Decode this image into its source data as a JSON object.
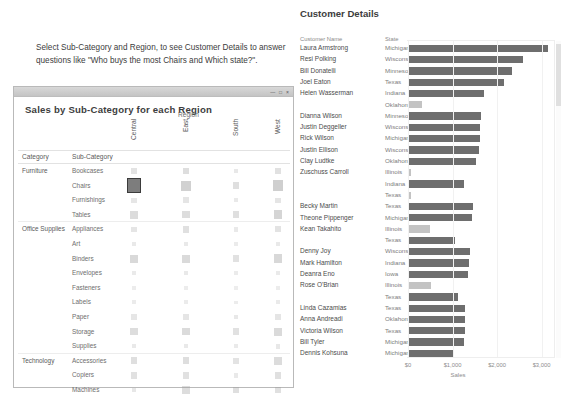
{
  "instruction": {
    "text": "Select  Sub-Category and Region, to see Customer Details to answer questions like \"Who buys the most Chairs and Which state?\"."
  },
  "matrix_window": {
    "title": "Sales by Sub-Category for each Region",
    "window_controls": "— □ ×",
    "region_label": "Region",
    "header_category": "Category",
    "header_subcategory": "Sub-Category",
    "columns": [
      "Central",
      "East",
      "South",
      "West"
    ],
    "groups": [
      {
        "category": "Furniture",
        "rows": [
          {
            "sub_category": "Bookcases",
            "values": [
              0.3,
              0.42,
              0.18,
              0.34
            ]
          },
          {
            "sub_category": "Chairs",
            "values": [
              1.0,
              0.72,
              0.4,
              0.78
            ],
            "selected_column": "Central"
          },
          {
            "sub_category": "Furnishings",
            "values": [
              0.22,
              0.26,
              0.14,
              0.24
            ]
          },
          {
            "sub_category": "Tables",
            "values": [
              0.48,
              0.46,
              0.4,
              0.62
            ]
          }
        ]
      },
      {
        "category": "Office Supplies",
        "rows": [
          {
            "sub_category": "Appliances",
            "values": [
              0.26,
              0.38,
              0.16,
              0.3
            ]
          },
          {
            "sub_category": "Art",
            "values": [
              0.14,
              0.16,
              0.1,
              0.15
            ]
          },
          {
            "sub_category": "Binders",
            "values": [
              0.54,
              0.52,
              0.34,
              0.58
            ]
          },
          {
            "sub_category": "Envelopes",
            "values": [
              0.13,
              0.14,
              0.1,
              0.13
            ]
          },
          {
            "sub_category": "Fasteners",
            "values": [
              0.07,
              0.07,
              0.06,
              0.07
            ]
          },
          {
            "sub_category": "Labels",
            "values": [
              0.1,
              0.1,
              0.08,
              0.12
            ]
          },
          {
            "sub_category": "Paper",
            "values": [
              0.22,
              0.26,
              0.18,
              0.26
            ]
          },
          {
            "sub_category": "Storage",
            "values": [
              0.46,
              0.5,
              0.34,
              0.52
            ]
          },
          {
            "sub_category": "Supplies",
            "values": [
              0.16,
              0.16,
              0.12,
              0.18
            ]
          }
        ]
      },
      {
        "category": "Technology",
        "rows": [
          {
            "sub_category": "Accessories",
            "values": [
              0.4,
              0.42,
              0.3,
              0.48
            ]
          },
          {
            "sub_category": "Copiers",
            "values": [
              0.34,
              0.34,
              0.16,
              0.38
            ]
          },
          {
            "sub_category": "Machines",
            "values": [
              0.2,
              0.44,
              0.4,
              0.38
            ]
          },
          {
            "sub_category": "Phones",
            "values": [
              0.56,
              0.58,
              0.44,
              0.62
            ]
          }
        ]
      }
    ]
  },
  "customer_panel": {
    "title": "Customer Details",
    "header_name": "Customer Name",
    "header_state": "State"
  },
  "chart_data": {
    "type": "bar",
    "title": "Customer Details",
    "xlabel": "Sales",
    "ylabel": "",
    "orientation": "horizontal",
    "xlim": [
      0,
      3250
    ],
    "xticks": [
      0,
      1000,
      2000,
      3000
    ],
    "xtick_labels": [
      "$0",
      "$1,000",
      "$2,000",
      "$3,000"
    ],
    "grid": false,
    "columns": [
      "Customer Name",
      "State",
      "Sales"
    ],
    "rows": [
      {
        "customer_name": "Laura Armstrong",
        "state": "Michigan",
        "sales": 3140,
        "highlight": true
      },
      {
        "customer_name": "Resi Polking",
        "state": "Wisconsin",
        "sales": 2580,
        "highlight": true
      },
      {
        "customer_name": "Bill Donatelli",
        "state": "Minnesota",
        "sales": 2330,
        "highlight": true
      },
      {
        "customer_name": "Joel Eaton",
        "state": "Texas",
        "sales": 2160,
        "highlight": true
      },
      {
        "customer_name": "Helen Wasserman",
        "state": "Indiana",
        "sales": 1710,
        "highlight": true
      },
      {
        "customer_name": "",
        "state": "Oklahoma",
        "sales": 310,
        "highlight": false
      },
      {
        "customer_name": "Dianna Wilson",
        "state": "Minnesota",
        "sales": 1630,
        "highlight": true
      },
      {
        "customer_name": "Justin Deggeller",
        "state": "Wisconsin",
        "sales": 1620,
        "highlight": true
      },
      {
        "customer_name": "Rick Wilson",
        "state": "Michigan",
        "sales": 1610,
        "highlight": true
      },
      {
        "customer_name": "Justin Ellison",
        "state": "Wisconsin",
        "sales": 1590,
        "highlight": true
      },
      {
        "customer_name": "Clay Ludtke",
        "state": "Oklahoma",
        "sales": 1530,
        "highlight": true
      },
      {
        "customer_name": "Zuschuss Carroll",
        "state": "Illinois",
        "sales": 70,
        "highlight": false
      },
      {
        "customer_name": "",
        "state": "Indiana",
        "sales": 1260,
        "highlight": true
      },
      {
        "customer_name": "",
        "state": "Texas",
        "sales": 70,
        "highlight": false
      },
      {
        "customer_name": "Becky Martin",
        "state": "Texas",
        "sales": 1450,
        "highlight": true
      },
      {
        "customer_name": "Theone Pippenger",
        "state": "Michigan",
        "sales": 1440,
        "highlight": true
      },
      {
        "customer_name": "Kean Takahito",
        "state": "Illinois",
        "sales": 500,
        "highlight": false
      },
      {
        "customer_name": "",
        "state": "Texas",
        "sales": 1050,
        "highlight": true
      },
      {
        "customer_name": "Denny Joy",
        "state": "Wisconsin",
        "sales": 1400,
        "highlight": true
      },
      {
        "customer_name": "Mark Hamilton",
        "state": "Indiana",
        "sales": 1380,
        "highlight": true
      },
      {
        "customer_name": "Deanra Eno",
        "state": "Iowa",
        "sales": 1350,
        "highlight": true
      },
      {
        "customer_name": "Rose O'Brian",
        "state": "Illinois",
        "sales": 520,
        "highlight": false
      },
      {
        "customer_name": "",
        "state": "Texas",
        "sales": 1130,
        "highlight": true
      },
      {
        "customer_name": "Linda Cazamias",
        "state": "Texas",
        "sales": 1290,
        "highlight": true
      },
      {
        "customer_name": "Anna Andreadi",
        "state": "Oklahoma",
        "sales": 1280,
        "highlight": true
      },
      {
        "customer_name": "Victoria Wilson",
        "state": "Texas",
        "sales": 1270,
        "highlight": true
      },
      {
        "customer_name": "Bill Tyler",
        "state": "Michigan",
        "sales": 1260,
        "highlight": true
      },
      {
        "customer_name": "Dennis Kohsuna",
        "state": "Michigan",
        "sales": 1020,
        "highlight": true
      }
    ]
  }
}
